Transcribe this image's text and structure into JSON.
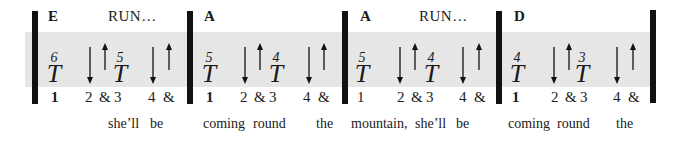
{
  "cue_text": "RUN…",
  "measures": [
    {
      "chord": "E",
      "cue": "RUN…",
      "strums": [
        {
          "beat": "1",
          "fret": "6",
          "label": "T"
        },
        {
          "beat": "3",
          "fret": "5",
          "label": "T"
        }
      ],
      "counts": [
        "1",
        "2",
        "&",
        "3",
        "4",
        "&"
      ]
    },
    {
      "chord": "A",
      "cue": "",
      "strums": [
        {
          "beat": "1",
          "fret": "5",
          "label": "T"
        },
        {
          "beat": "3",
          "fret": "4",
          "label": "T"
        }
      ],
      "counts": [
        "1",
        "2",
        "&",
        "3",
        "4",
        "&"
      ]
    },
    {
      "chord": "A",
      "cue": "RUN…",
      "strums": [
        {
          "beat": "1",
          "fret": "5",
          "label": "T"
        },
        {
          "beat": "3",
          "fret": "4",
          "label": "T"
        }
      ],
      "counts": [
        "1",
        "2",
        "&",
        "3",
        "4",
        "&"
      ]
    },
    {
      "chord": "D",
      "cue": "",
      "strums": [
        {
          "beat": "1",
          "fret": "4",
          "label": "T"
        },
        {
          "beat": "3",
          "fret": "3",
          "label": "T"
        }
      ],
      "counts": [
        "1",
        "2",
        "&",
        "3",
        "4",
        "&"
      ]
    }
  ],
  "lyrics": [
    {
      "text": "she’ll",
      "x": 108
    },
    {
      "text": "be",
      "x": 150
    },
    {
      "text": "coming",
      "x": 203
    },
    {
      "text": "round",
      "x": 253
    },
    {
      "text": "the",
      "x": 316
    },
    {
      "text": "mountain,",
      "x": 351
    },
    {
      "text": "she’ll",
      "x": 415
    },
    {
      "text": "be",
      "x": 456
    },
    {
      "text": "coming",
      "x": 508
    },
    {
      "text": "round",
      "x": 557
    },
    {
      "text": "the",
      "x": 616
    }
  ],
  "arrow_legend": {
    "down": "down-strum",
    "up": "up-strum"
  },
  "colors": {
    "band": "#e6e6e6",
    "bar": "#111111",
    "text": "#1a1a1a"
  }
}
